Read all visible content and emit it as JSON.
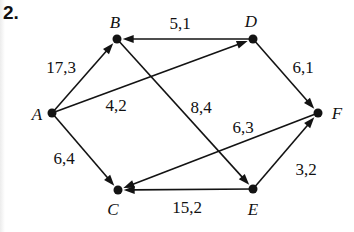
{
  "problem_number": "2.",
  "figure": {
    "type": "directed-graph-flow-network",
    "ink_color": "#131313",
    "background_color": "#ffffff",
    "nodes": [
      {
        "id": "A",
        "label": "A",
        "x": 52,
        "y": 113,
        "label_x": 37,
        "label_y": 120
      },
      {
        "id": "B",
        "label": "B",
        "x": 117,
        "y": 39,
        "label_x": 115,
        "label_y": 28
      },
      {
        "id": "C",
        "label": "C",
        "x": 118,
        "y": 190,
        "label_x": 113,
        "label_y": 215
      },
      {
        "id": "D",
        "label": "D",
        "x": 253,
        "y": 39,
        "label_x": 251,
        "label_y": 27
      },
      {
        "id": "E",
        "label": "E",
        "x": 253,
        "y": 189,
        "label_x": 253,
        "label_y": 215
      },
      {
        "id": "F",
        "label": "F",
        "x": 318,
        "y": 113,
        "label_x": 337,
        "label_y": 119
      }
    ],
    "edges": [
      {
        "from": "A",
        "to": "B",
        "label": "17,3",
        "label_x": 61,
        "label_y": 73
      },
      {
        "from": "A",
        "to": "D",
        "label": "4,2",
        "label_x": 116,
        "label_y": 111
      },
      {
        "from": "A",
        "to": "C",
        "label": "6,4",
        "label_x": 64,
        "label_y": 164
      },
      {
        "from": "D",
        "to": "B",
        "label": "5,1",
        "label_x": 180,
        "label_y": 29
      },
      {
        "from": "D",
        "to": "F",
        "label": "6,1",
        "label_x": 303,
        "label_y": 73
      },
      {
        "from": "B",
        "to": "E",
        "label": "8,4",
        "label_x": 201,
        "label_y": 113
      },
      {
        "from": "F",
        "to": "C",
        "label": "6,3",
        "label_x": 243,
        "label_y": 133
      },
      {
        "from": "E",
        "to": "C",
        "label": "15,2",
        "label_x": 187,
        "label_y": 213
      },
      {
        "from": "E",
        "to": "F",
        "label": "3,2",
        "label_x": 306,
        "label_y": 175
      }
    ]
  }
}
